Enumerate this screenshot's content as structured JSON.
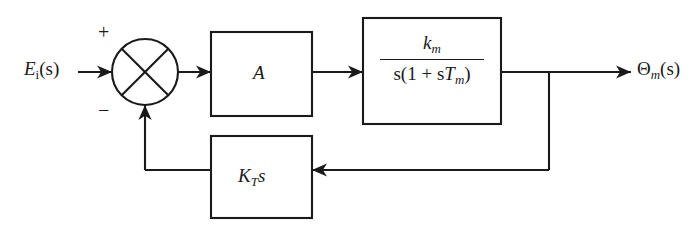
{
  "diagram": {
    "type": "control-system-block-diagram",
    "title": "",
    "stroke_color": "#1a1a1a",
    "background_color": "#ffffff",
    "signals": {
      "input": {
        "base": "E",
        "subscript": "i",
        "argument": "(s)",
        "full": "E_i(s)"
      },
      "output": {
        "base": "Θ",
        "subscript": "m",
        "argument": "(s)",
        "full": "Θ_m(s)"
      }
    },
    "summing_junction": {
      "style": "circle-with-x",
      "positive_sign": "+",
      "negative_sign": "−"
    },
    "blocks": [
      {
        "id": "gain",
        "label": "A",
        "kind": "forward"
      },
      {
        "id": "plant",
        "label": "k_m / (s(1 + sT_m))",
        "numerator_base": "k",
        "numerator_subscript": "m",
        "denominator_prefix": "s(1 + s",
        "denominator_base": "T",
        "denominator_subscript": "m",
        "denominator_suffix": ")",
        "kind": "forward"
      },
      {
        "id": "feedback",
        "label": "K_T s",
        "base": "K",
        "subscript": "T",
        "suffix": "s",
        "kind": "feedback"
      }
    ]
  }
}
